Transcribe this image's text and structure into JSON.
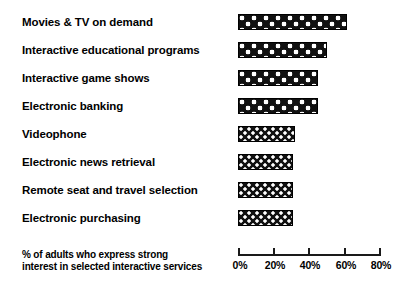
{
  "chart_data": {
    "type": "bar",
    "orientation": "horizontal",
    "title": "",
    "subtitle": "",
    "xlabel": "% of adults who express strong interest in selected interactive services",
    "ylabel": "",
    "xlim": [
      0,
      80
    ],
    "grid": false,
    "legend": null,
    "tick_labels": [
      "0%",
      "20%",
      "40%",
      "60%",
      "80%"
    ],
    "tick_values": [
      0,
      20,
      40,
      60,
      80
    ],
    "categories": [
      "Movies & TV on demand",
      "Interactive educational programs",
      "Interactive game shows",
      "Electronic banking",
      "Videophone",
      "Electronic news retrieval",
      "Remote seat and travel selection",
      "Electronic purchasing"
    ],
    "values": [
      61,
      50,
      45,
      45,
      32,
      31,
      31,
      31
    ],
    "series": [
      {
        "name": "% of adults expressing strong interest",
        "values": [
          61,
          50,
          45,
          45,
          32,
          31,
          31,
          31
        ]
      }
    ],
    "bar_fill_patterns": [
      "large-polka-dots",
      "large-polka-dots",
      "large-polka-dots",
      "large-polka-dots",
      "small-polka-dots",
      "small-polka-dots",
      "small-polka-dots",
      "small-polka-dots"
    ],
    "colors": {
      "bar_fill": "#111111",
      "bar_dot": "#ffffff",
      "bar_border": "#000000",
      "axis": "#1a1a1a",
      "text": "#000000",
      "background": "#ffffff"
    }
  },
  "caption": {
    "line1": "% of adults who express strong",
    "line2": "interest in selected interactive services"
  }
}
